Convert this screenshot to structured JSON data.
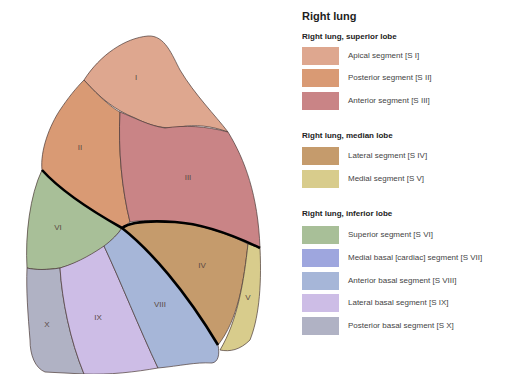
{
  "title": "Right lung",
  "groups": [
    {
      "title": "Right lung, superior lobe",
      "items": [
        {
          "label": "Apical segment [S I]",
          "code": "I",
          "color": "#dea78f"
        },
        {
          "label": "Posterior segment [S II]",
          "code": "II",
          "color": "#d99a74"
        },
        {
          "label": "Anterior segment [S III]",
          "code": "III",
          "color": "#c98486"
        }
      ]
    },
    {
      "title": "Right lung, median lobe",
      "items": [
        {
          "label": "Lateral segment [S IV]",
          "code": "IV",
          "color": "#c59b6c"
        },
        {
          "label": "Medial segment [S V]",
          "code": "V",
          "color": "#d8cc8c"
        }
      ]
    },
    {
      "title": "Right lung, inferior lobe",
      "items": [
        {
          "label": "Superior segment [S VI]",
          "code": "VI",
          "color": "#a8bf98"
        },
        {
          "label": "Medial basal [cardiac] segment [S VII]",
          "code": "VII",
          "color": "#9ea6de"
        },
        {
          "label": "Anterior basal segment  [S VIII]",
          "code": "VIII",
          "color": "#a6b6d8"
        },
        {
          "label": "Lateral basal segment [S IX]",
          "code": "IX",
          "color": "#cdbde6"
        },
        {
          "label": "Posterior basal segment [S X]",
          "code": "X",
          "color": "#b0b2c4"
        }
      ]
    }
  ],
  "diagram_labels": {
    "I": "I",
    "II": "II",
    "III": "III",
    "IV": "IV",
    "V": "V",
    "VI": "VI",
    "VIII": "VIII",
    "IX": "IX",
    "X": "X"
  }
}
